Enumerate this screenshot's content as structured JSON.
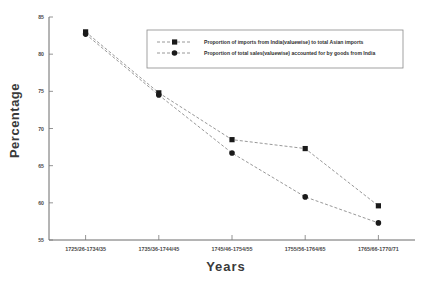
{
  "chart_data": {
    "type": "line",
    "title": "",
    "xlabel": "Years",
    "ylabel": "Percentage",
    "categories": [
      "1725/26-1734/35",
      "1735/36-1744/45",
      "1745/46-1754/55",
      "1755/56-1764/65",
      "1765/66-1770/71"
    ],
    "series": [
      {
        "name": "Proportion of imports from India(valuewise) to total Asian imports",
        "marker": "square",
        "linestyle": "dashed",
        "values": [
          83.0,
          74.8,
          68.5,
          67.3,
          59.6
        ]
      },
      {
        "name": "Proportion of total sales(valuewise) accounted for by goods from India",
        "marker": "circle",
        "linestyle": "dashed",
        "values": [
          82.7,
          74.5,
          66.7,
          60.8,
          57.3
        ]
      }
    ],
    "ylim": [
      55,
      85
    ],
    "yticks": [
      55,
      60,
      65,
      70,
      75,
      80,
      85
    ],
    "ytick_labels": [
      "55",
      "60",
      "65",
      "70",
      "75",
      "80",
      "85"
    ],
    "grid": false,
    "legend_position": "top-center"
  },
  "colors": {
    "marker": "#1a1a1a",
    "line": "#8c8c8c",
    "axis": "#6b6b6b",
    "text": "#3a3a3a",
    "background": "#ffffff"
  }
}
